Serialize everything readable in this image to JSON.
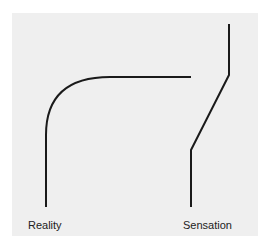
{
  "diagram": {
    "labels": {
      "left": "Reality",
      "right": "Sensation"
    },
    "colors": {
      "background": "#efefef",
      "stroke": "#1a1a1a",
      "text": "#222222"
    },
    "paths": {
      "reality_curve": "M46 207 L46 135 Q46 77 110 77 L191 77",
      "sensation_line": "M191 207 L191 150 L229 75 L229 24"
    }
  }
}
